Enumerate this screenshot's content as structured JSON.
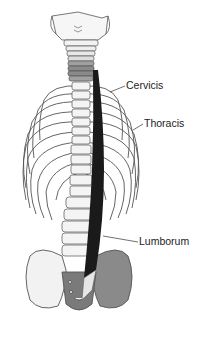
{
  "figure": {
    "colors": {
      "bone_fill": "#f4f4f4",
      "bone_outline": "#555555",
      "muscle": "#1a1a1a",
      "shaded_bone": "#8a8a8a",
      "label_text": "#222222"
    }
  },
  "labels": [
    {
      "id": "cervicis",
      "text": "Cervicis"
    },
    {
      "id": "thoracis",
      "text": "Thoracis"
    },
    {
      "id": "lumborum",
      "text": "Lumborum"
    }
  ]
}
